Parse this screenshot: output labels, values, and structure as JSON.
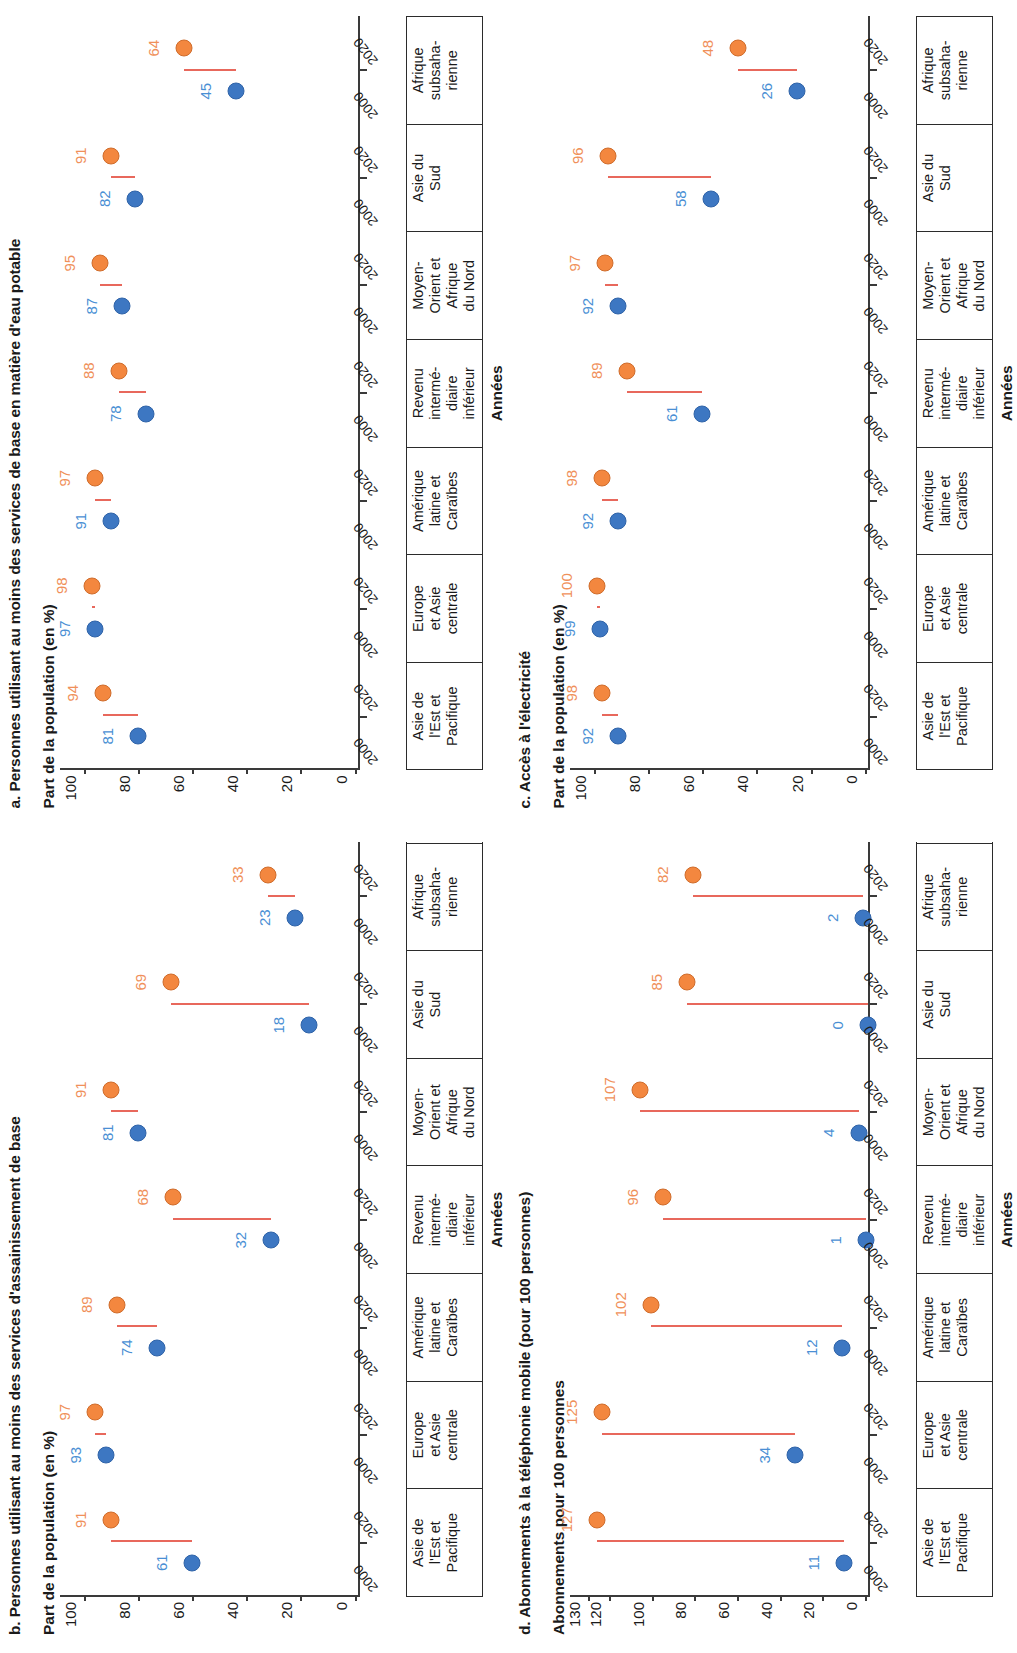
{
  "colors": {
    "series_2000": "#3d77c2",
    "series_2020": "#f3873f",
    "label_2000": "#4a8fd4",
    "label_2020": "#f0905a",
    "connector": "#e8685c",
    "axis": "#3a3a3a"
  },
  "regions": [
    {
      "lines": [
        "Asie de",
        "l'Est et",
        "Pacifique"
      ]
    },
    {
      "lines": [
        "Europe",
        "et Asie",
        "centrale"
      ]
    },
    {
      "lines": [
        "Amérique",
        "latine et",
        "Caraïbes"
      ]
    },
    {
      "lines": [
        "Revenu",
        "intermé-",
        "diaire",
        "inférieur"
      ]
    },
    {
      "lines": [
        "Moyen-",
        "Orient et",
        "Afrique",
        "du Nord"
      ]
    },
    {
      "lines": [
        "Asie du",
        "Sud"
      ]
    },
    {
      "lines": [
        "Afrique",
        "subsaha-",
        "rienne"
      ]
    }
  ],
  "years": {
    "first": "2000",
    "second": "2020"
  },
  "xaxis_title": "Années",
  "panels": [
    {
      "id": "a",
      "title": "a. Personnes utilisant au moins des services de base en matière d'eau potable",
      "axis_title": "Part de la population (en %)",
      "chart_data": {
        "type": "scatter",
        "title": "a. Personnes utilisant au moins des services de base en matière d'eau potable",
        "ylabel": "Part de la population (en %)",
        "xlabel": "Années",
        "ylim": [
          0,
          110
        ],
        "yticks": [
          0,
          20,
          40,
          60,
          80,
          100
        ],
        "grid": false,
        "legend": "none",
        "categories": [
          "Asie de l'Est et Pacifique",
          "Europe et Asie centrale",
          "Amérique latine et Caraïbes",
          "Revenu intermédiaire inférieur",
          "Moyen-Orient et Afrique du Nord",
          "Asie du Sud",
          "Afrique subsaharienne"
        ],
        "series": [
          {
            "name": "2000",
            "values": [
              81,
              97,
              91,
              78,
              87,
              82,
              45
            ]
          },
          {
            "name": "2020",
            "values": [
              94,
              98,
              97,
              88,
              95,
              91,
              64
            ]
          }
        ]
      }
    },
    {
      "id": "b",
      "title": "b. Personnes utilisant au moins des services d'assainissement de base",
      "axis_title": "Part de la population (en %)",
      "chart_data": {
        "type": "scatter",
        "title": "b. Personnes utilisant au moins des services d'assainissement de base",
        "ylabel": "Part de la population (en %)",
        "xlabel": "Années",
        "ylim": [
          0,
          110
        ],
        "yticks": [
          0,
          20,
          40,
          60,
          80,
          100
        ],
        "grid": false,
        "legend": "none",
        "categories": [
          "Asie de l'Est et Pacifique",
          "Europe et Asie centrale",
          "Amérique latine et Caraïbes",
          "Revenu intermédiaire inférieur",
          "Moyen-Orient et Afrique du Nord",
          "Asie du Sud",
          "Afrique subsaharienne"
        ],
        "series": [
          {
            "name": "2000",
            "values": [
              61,
              93,
              74,
              32,
              81,
              18,
              23
            ]
          },
          {
            "name": "2020",
            "values": [
              91,
              97,
              89,
              68,
              91,
              69,
              33
            ]
          }
        ]
      }
    },
    {
      "id": "c",
      "title": "c. Accès à l'électricité",
      "axis_title": "Part de la population (en %)",
      "chart_data": {
        "type": "scatter",
        "title": "c. Accès à l'électricité",
        "ylabel": "Part de la population (en %)",
        "xlabel": "Années",
        "ylim": [
          0,
          110
        ],
        "yticks": [
          0,
          20,
          40,
          60,
          80,
          100
        ],
        "grid": false,
        "legend": "none",
        "categories": [
          "Asie de l'Est et Pacifique",
          "Europe et Asie centrale",
          "Amérique latine et Caraïbes",
          "Revenu intermédiaire inférieur",
          "Moyen-Orient et Afrique du Nord",
          "Asie du Sud",
          "Afrique subsaharienne"
        ],
        "series": [
          {
            "name": "2000",
            "values": [
              92,
              99,
              92,
              61,
              92,
              58,
              26
            ]
          },
          {
            "name": "2020",
            "values": [
              98,
              100,
              98,
              89,
              97,
              96,
              48
            ]
          }
        ]
      }
    },
    {
      "id": "d",
      "title": "d. Abonnements à la téléphonie mobile (pour 100 personnes)",
      "axis_title": "Abonnements pour 100 personnes",
      "chart_data": {
        "type": "scatter",
        "title": "d. Abonnements à la téléphonie mobile (pour 100 personnes)",
        "ylabel": "Abonnements pour 100 personnes",
        "xlabel": "Années",
        "ylim": [
          0,
          140
        ],
        "yticks": [
          0,
          20,
          40,
          60,
          80,
          100,
          120,
          130
        ],
        "grid": false,
        "legend": "none",
        "categories": [
          "Asie de l'Est et Pacifique",
          "Europe et Asie centrale",
          "Amérique latine et Caraïbes",
          "Revenu intermédiaire inférieur",
          "Moyen-Orient et Afrique du Nord",
          "Asie du Sud",
          "Afrique subsaharienne"
        ],
        "series": [
          {
            "name": "2000",
            "values": [
              11,
              34,
              12,
              1,
              4,
              0,
              2
            ]
          },
          {
            "name": "2020",
            "values": [
              127,
              125,
              102,
              96,
              107,
              85,
              82
            ]
          }
        ]
      }
    }
  ]
}
